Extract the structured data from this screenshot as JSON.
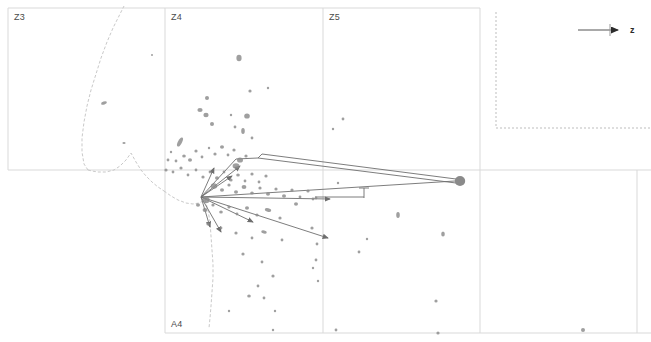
{
  "figure": {
    "kind": "scatter-vector-field",
    "background": "#ffffff",
    "grid_color": "#d9d9d9",
    "marker_color": "#8a8a8a",
    "vector_color": "#6e6e6e",
    "contour_color": "#c9c9c9",
    "label_color": "#4a4a4a"
  },
  "panels": [
    {
      "id": "Z3",
      "label": "Z3",
      "x": 8,
      "y": 8,
      "w": 157,
      "h": 162,
      "label_x": 14,
      "label_y": 12
    },
    {
      "id": "Z4",
      "label": "Z4",
      "x": 165,
      "y": 8,
      "w": 158,
      "h": 162,
      "label_x": 171,
      "label_y": 12
    },
    {
      "id": "Z5",
      "label": "Z5",
      "x": 323,
      "y": 8,
      "w": 157,
      "h": 162,
      "label_x": 329,
      "label_y": 12
    },
    {
      "id": "A4",
      "label": "A4",
      "x": 165,
      "y": 170,
      "w": 158,
      "h": 163,
      "label_x": 171,
      "label_y": 319
    }
  ],
  "axis_indicator": {
    "label": "z",
    "name": "z-axis-arrow",
    "line_x1": 578,
    "line_x2": 617,
    "line_y": 30,
    "tick_x": 610,
    "tick_y1": 24,
    "tick_y2": 36,
    "arrow_tip_x": 624,
    "arrow_tip_y": 30,
    "label_x": 630,
    "label_y": 25
  },
  "dotted_boundary": {
    "name": "dotted-corner-boundary",
    "points": "496,12 496,128 651,128"
  },
  "grid_lines": {
    "horizontal": [
      {
        "x1": 8,
        "x2": 480,
        "y": 8
      },
      {
        "x1": 8,
        "x2": 651,
        "y": 170
      },
      {
        "x1": 165,
        "x2": 651,
        "y": 333
      }
    ],
    "vertical": [
      {
        "y1": 8,
        "y2": 170,
        "x": 8
      },
      {
        "y1": 8,
        "y2": 333,
        "x": 165
      },
      {
        "y1": 8,
        "y2": 333,
        "x": 323
      },
      {
        "y1": 8,
        "y2": 333,
        "x": 480
      },
      {
        "y1": 170,
        "y2": 333,
        "x": 637
      }
    ]
  },
  "contours": [
    {
      "name": "contour-left-ridge",
      "points": "88,170 84,164 82,152 82,138 84,122 87,106 91,90 96,74 101,58 107,42 113,28 119,16 124,6"
    },
    {
      "name": "contour-left-valley",
      "points": "88,170 92,171 98,172 106,172 114,170 120,166 126,160 131,153 136,162 141,170 146,176 152,182 158,187 164,191"
    },
    {
      "name": "contour-lower-tail",
      "points": "164,191 171,196 178,200 186,203 193,204 199,203 205,200 210,196"
    },
    {
      "name": "contour-descending",
      "points": "205,200 208,210 210,222 211,236 212,250 213,264 213,278 212,292 211,306 210,318 209,328"
    }
  ],
  "markers": [
    {
      "x": 104,
      "y": 103,
      "rx": 3.0,
      "ry": 1.6,
      "rot": -18
    },
    {
      "x": 124,
      "y": 143,
      "rx": 1.6,
      "ry": 1.1,
      "rot": 0
    },
    {
      "x": 239,
      "y": 58,
      "rx": 2.6,
      "ry": 3.2,
      "rot": 0
    },
    {
      "x": 250,
      "y": 91,
      "rx": 1.6,
      "ry": 1.6,
      "rot": 0
    },
    {
      "x": 268,
      "y": 88,
      "rx": 1.2,
      "ry": 1.2,
      "rot": 0
    },
    {
      "x": 207,
      "y": 98,
      "rx": 2.0,
      "ry": 2.0,
      "rot": 0
    },
    {
      "x": 200,
      "y": 110,
      "rx": 2.6,
      "ry": 2.0,
      "rot": 0
    },
    {
      "x": 206,
      "y": 115,
      "rx": 2.6,
      "ry": 2.2,
      "rot": 0
    },
    {
      "x": 212,
      "y": 124,
      "rx": 2.0,
      "ry": 2.0,
      "rot": 0
    },
    {
      "x": 231,
      "y": 115,
      "rx": 1.2,
      "ry": 1.2,
      "rot": 0
    },
    {
      "x": 247,
      "y": 116,
      "rx": 2.8,
      "ry": 2.6,
      "rot": 0
    },
    {
      "x": 243,
      "y": 131,
      "rx": 1.8,
      "ry": 3.0,
      "rot": 0
    },
    {
      "x": 235,
      "y": 127,
      "rx": 1.4,
      "ry": 1.4,
      "rot": 0
    },
    {
      "x": 252,
      "y": 138,
      "rx": 1.4,
      "ry": 1.4,
      "rot": 0
    },
    {
      "x": 180,
      "y": 142,
      "rx": 2.0,
      "ry": 5.0,
      "rot": 28
    },
    {
      "x": 171,
      "y": 152,
      "rx": 1.2,
      "ry": 1.2,
      "rot": 0
    },
    {
      "x": 168,
      "y": 160,
      "rx": 1.4,
      "ry": 1.4,
      "rot": 0
    },
    {
      "x": 176,
      "y": 161,
      "rx": 1.4,
      "ry": 1.4,
      "rot": 0
    },
    {
      "x": 184,
      "y": 156,
      "rx": 1.8,
      "ry": 1.6,
      "rot": 0
    },
    {
      "x": 190,
      "y": 160,
      "rx": 2.0,
      "ry": 1.8,
      "rot": 0
    },
    {
      "x": 196,
      "y": 151,
      "rx": 1.6,
      "ry": 1.6,
      "rot": 0
    },
    {
      "x": 202,
      "y": 157,
      "rx": 1.4,
      "ry": 1.4,
      "rot": 0
    },
    {
      "x": 209,
      "y": 148,
      "rx": 1.2,
      "ry": 1.2,
      "rot": 0
    },
    {
      "x": 215,
      "y": 154,
      "rx": 1.6,
      "ry": 1.6,
      "rot": 0
    },
    {
      "x": 222,
      "y": 147,
      "rx": 2.0,
      "ry": 1.8,
      "rot": 0
    },
    {
      "x": 228,
      "y": 155,
      "rx": 1.4,
      "ry": 1.4,
      "rot": 0
    },
    {
      "x": 234,
      "y": 150,
      "rx": 1.6,
      "ry": 1.6,
      "rot": 0
    },
    {
      "x": 240,
      "y": 160,
      "rx": 3.0,
      "ry": 2.6,
      "rot": 0
    },
    {
      "x": 246,
      "y": 156,
      "rx": 1.6,
      "ry": 1.6,
      "rot": 0
    },
    {
      "x": 236,
      "y": 166,
      "rx": 3.4,
      "ry": 2.8,
      "rot": 0
    },
    {
      "x": 166,
      "y": 170,
      "rx": 1.6,
      "ry": 1.6,
      "rot": 0
    },
    {
      "x": 173,
      "y": 172,
      "rx": 1.4,
      "ry": 1.4,
      "rot": 0
    },
    {
      "x": 181,
      "y": 168,
      "rx": 1.6,
      "ry": 1.6,
      "rot": 0
    },
    {
      "x": 188,
      "y": 175,
      "rx": 1.4,
      "ry": 1.4,
      "rot": 0
    },
    {
      "x": 196,
      "y": 170,
      "rx": 1.4,
      "ry": 1.4,
      "rot": 0
    },
    {
      "x": 203,
      "y": 177,
      "rx": 1.6,
      "ry": 1.6,
      "rot": 0
    },
    {
      "x": 210,
      "y": 172,
      "rx": 1.4,
      "ry": 1.4,
      "rot": 0
    },
    {
      "x": 217,
      "y": 178,
      "rx": 2.0,
      "ry": 1.8,
      "rot": 0
    },
    {
      "x": 224,
      "y": 172,
      "rx": 1.4,
      "ry": 1.4,
      "rot": 0
    },
    {
      "x": 231,
      "y": 180,
      "rx": 1.6,
      "ry": 1.6,
      "rot": 0
    },
    {
      "x": 238,
      "y": 175,
      "rx": 1.8,
      "ry": 1.6,
      "rot": 0
    },
    {
      "x": 245,
      "y": 181,
      "rx": 1.4,
      "ry": 1.4,
      "rot": 0
    },
    {
      "x": 252,
      "y": 174,
      "rx": 1.6,
      "ry": 1.6,
      "rot": 0
    },
    {
      "x": 259,
      "y": 182,
      "rx": 1.4,
      "ry": 1.4,
      "rot": 0
    },
    {
      "x": 266,
      "y": 176,
      "rx": 1.6,
      "ry": 1.6,
      "rot": 0
    },
    {
      "x": 214,
      "y": 186,
      "rx": 3.2,
      "ry": 2.8,
      "rot": 0
    },
    {
      "x": 222,
      "y": 190,
      "rx": 2.0,
      "ry": 1.8,
      "rot": 0
    },
    {
      "x": 229,
      "y": 185,
      "rx": 1.6,
      "ry": 1.6,
      "rot": 0
    },
    {
      "x": 236,
      "y": 192,
      "rx": 2.0,
      "ry": 1.8,
      "rot": 0
    },
    {
      "x": 244,
      "y": 187,
      "rx": 2.4,
      "ry": 2.0,
      "rot": 0
    },
    {
      "x": 252,
      "y": 193,
      "rx": 1.8,
      "ry": 1.6,
      "rot": 0
    },
    {
      "x": 260,
      "y": 188,
      "rx": 1.6,
      "ry": 1.6,
      "rot": 0
    },
    {
      "x": 268,
      "y": 194,
      "rx": 2.0,
      "ry": 1.8,
      "rot": 0
    },
    {
      "x": 276,
      "y": 189,
      "rx": 1.6,
      "ry": 1.6,
      "rot": 0
    },
    {
      "x": 284,
      "y": 196,
      "rx": 2.0,
      "ry": 1.8,
      "rot": 0
    },
    {
      "x": 292,
      "y": 190,
      "rx": 1.6,
      "ry": 1.6,
      "rot": 0
    },
    {
      "x": 300,
      "y": 197,
      "rx": 1.4,
      "ry": 1.4,
      "rot": 0
    },
    {
      "x": 308,
      "y": 191,
      "rx": 1.6,
      "ry": 1.6,
      "rot": 0
    },
    {
      "x": 316,
      "y": 198,
      "rx": 1.4,
      "ry": 1.4,
      "rot": 0
    },
    {
      "x": 206,
      "y": 200,
      "rx": 3.6,
      "ry": 3.2,
      "rot": 0
    },
    {
      "x": 198,
      "y": 205,
      "rx": 2.0,
      "ry": 1.8,
      "rot": 0
    },
    {
      "x": 205,
      "y": 210,
      "rx": 2.4,
      "ry": 2.0,
      "rot": 0
    },
    {
      "x": 213,
      "y": 205,
      "rx": 1.6,
      "ry": 1.6,
      "rot": 0
    },
    {
      "x": 221,
      "y": 212,
      "rx": 1.8,
      "ry": 1.6,
      "rot": 0
    },
    {
      "x": 229,
      "y": 207,
      "rx": 1.6,
      "ry": 1.6,
      "rot": 0
    },
    {
      "x": 237,
      "y": 214,
      "rx": 1.4,
      "ry": 1.4,
      "rot": 0
    },
    {
      "x": 247,
      "y": 208,
      "rx": 2.0,
      "ry": 1.8,
      "rot": 0
    },
    {
      "x": 257,
      "y": 215,
      "rx": 1.6,
      "ry": 1.6,
      "rot": 0
    },
    {
      "x": 268,
      "y": 210,
      "rx": 3.2,
      "ry": 1.8,
      "rot": 12
    },
    {
      "x": 280,
      "y": 218,
      "rx": 1.6,
      "ry": 1.6,
      "rot": 0
    },
    {
      "x": 296,
      "y": 204,
      "rx": 2.0,
      "ry": 1.8,
      "rot": 0
    },
    {
      "x": 313,
      "y": 199,
      "rx": 1.4,
      "ry": 1.4,
      "rot": 0
    },
    {
      "x": 208,
      "y": 224,
      "rx": 1.6,
      "ry": 1.6,
      "rot": 0
    },
    {
      "x": 221,
      "y": 228,
      "rx": 1.4,
      "ry": 1.4,
      "rot": 0
    },
    {
      "x": 236,
      "y": 233,
      "rx": 1.6,
      "ry": 1.6,
      "rot": 0
    },
    {
      "x": 252,
      "y": 238,
      "rx": 1.4,
      "ry": 1.4,
      "rot": 0
    },
    {
      "x": 264,
      "y": 232,
      "rx": 2.8,
      "ry": 1.6,
      "rot": 10
    },
    {
      "x": 282,
      "y": 240,
      "rx": 1.4,
      "ry": 1.4,
      "rot": 0
    },
    {
      "x": 312,
      "y": 228,
      "rx": 1.6,
      "ry": 1.6,
      "rot": 0
    },
    {
      "x": 317,
      "y": 244,
      "rx": 1.4,
      "ry": 1.4,
      "rot": 0
    },
    {
      "x": 316,
      "y": 260,
      "rx": 1.4,
      "ry": 1.4,
      "rot": 0
    },
    {
      "x": 243,
      "y": 254,
      "rx": 1.6,
      "ry": 1.6,
      "rot": 0
    },
    {
      "x": 262,
      "y": 262,
      "rx": 1.4,
      "ry": 1.4,
      "rot": 0
    },
    {
      "x": 273,
      "y": 276,
      "rx": 1.6,
      "ry": 1.6,
      "rot": 0
    },
    {
      "x": 258,
      "y": 286,
      "rx": 1.4,
      "ry": 1.4,
      "rot": 0
    },
    {
      "x": 249,
      "y": 296,
      "rx": 1.8,
      "ry": 1.6,
      "rot": 0
    },
    {
      "x": 264,
      "y": 298,
      "rx": 1.4,
      "ry": 1.4,
      "rot": 0
    },
    {
      "x": 229,
      "y": 311,
      "rx": 1.2,
      "ry": 1.2,
      "rot": 0
    },
    {
      "x": 275,
      "y": 311,
      "rx": 1.2,
      "ry": 1.2,
      "rot": 0
    },
    {
      "x": 313,
      "y": 268,
      "rx": 1.2,
      "ry": 1.2,
      "rot": 0
    },
    {
      "x": 318,
      "y": 281,
      "rx": 1.2,
      "ry": 1.2,
      "rot": 0
    },
    {
      "x": 343,
      "y": 119,
      "rx": 1.4,
      "ry": 1.4,
      "rot": 0
    },
    {
      "x": 333,
      "y": 129,
      "rx": 1.2,
      "ry": 1.2,
      "rot": 0
    },
    {
      "x": 398,
      "y": 215,
      "rx": 1.8,
      "ry": 3.0,
      "rot": 0
    },
    {
      "x": 359,
      "y": 252,
      "rx": 1.4,
      "ry": 1.4,
      "rot": 0
    },
    {
      "x": 367,
      "y": 239,
      "rx": 1.2,
      "ry": 1.2,
      "rot": 0
    },
    {
      "x": 443,
      "y": 234,
      "rx": 1.8,
      "ry": 2.6,
      "rot": 0
    },
    {
      "x": 338,
      "y": 183,
      "rx": 1.2,
      "ry": 1.2,
      "rot": 0
    },
    {
      "x": 436,
      "y": 301,
      "rx": 1.6,
      "ry": 1.6,
      "rot": 0
    },
    {
      "x": 583,
      "y": 330,
      "rx": 2.0,
      "ry": 2.0,
      "rot": 0
    },
    {
      "x": 273,
      "y": 330,
      "rx": 1.2,
      "ry": 1.2,
      "rot": 0
    },
    {
      "x": 438,
      "y": 333,
      "rx": 1.6,
      "ry": 1.6,
      "rot": 0
    },
    {
      "x": 336,
      "y": 330,
      "rx": 1.4,
      "ry": 1.4,
      "rot": 0
    },
    {
      "x": 152,
      "y": 55,
      "rx": 1.0,
      "ry": 1.0,
      "rot": 0
    }
  ],
  "big_node": {
    "name": "terminal-node",
    "x": 460,
    "y": 181,
    "rx": 5.2,
    "ry": 5.0
  },
  "vectors": [
    {
      "name": "vector-long-east",
      "x1": 201,
      "y1": 197,
      "x2": 455,
      "y2": 181,
      "head": false
    },
    {
      "name": "vector-wedge-upper",
      "x1": 262,
      "y1": 154,
      "x2": 456,
      "y2": 179,
      "head": false
    },
    {
      "name": "vector-wedge-lower",
      "x1": 258,
      "y1": 158,
      "x2": 456,
      "y2": 183,
      "head": false
    },
    {
      "name": "vector-wedge-cap",
      "x1": 258,
      "y1": 158,
      "x2": 262,
      "y2": 154,
      "head": false
    },
    {
      "name": "vector-east-short",
      "x1": 201,
      "y1": 197,
      "x2": 330,
      "y2": 199,
      "head": true
    },
    {
      "name": "vector-se-long",
      "x1": 201,
      "y1": 197,
      "x2": 328,
      "y2": 238,
      "head": true
    },
    {
      "name": "vector-se-mid",
      "x1": 201,
      "y1": 197,
      "x2": 253,
      "y2": 222,
      "head": true
    },
    {
      "name": "vector-se-steep",
      "x1": 201,
      "y1": 197,
      "x2": 221,
      "y2": 232,
      "head": true
    },
    {
      "name": "vector-south-steep",
      "x1": 201,
      "y1": 197,
      "x2": 210,
      "y2": 227,
      "head": true
    },
    {
      "name": "vector-ne-short",
      "x1": 201,
      "y1": 197,
      "x2": 232,
      "y2": 176,
      "head": true
    },
    {
      "name": "vector-ne-mid",
      "x1": 201,
      "y1": 197,
      "x2": 240,
      "y2": 166,
      "head": true
    },
    {
      "name": "vector-north",
      "x1": 201,
      "y1": 197,
      "x2": 214,
      "y2": 168,
      "head": true
    },
    {
      "name": "vector-up-ridge",
      "x1": 201,
      "y1": 197,
      "x2": 236,
      "y2": 159,
      "head": false
    },
    {
      "name": "vector-t-stem",
      "x1": 315,
      "y1": 197,
      "x2": 364,
      "y2": 197,
      "head": false
    },
    {
      "name": "vector-t-cap",
      "x1": 364,
      "y1": 188,
      "x2": 364,
      "y2": 198,
      "head": false
    },
    {
      "name": "vector-t-cap-top",
      "x1": 359,
      "y1": 188,
      "x2": 369,
      "y2": 188,
      "head": false
    },
    {
      "name": "vector-ridge-to-wedge",
      "x1": 236,
      "y1": 159,
      "x2": 258,
      "y2": 158,
      "head": false
    }
  ]
}
